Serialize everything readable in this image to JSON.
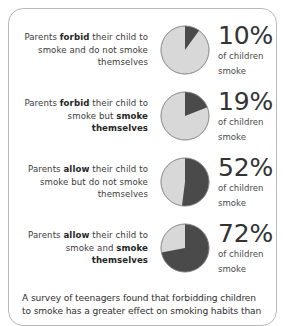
{
  "card": {
    "accent_dark": "#4a4a4a",
    "accent_light": "#d8d8d8",
    "border_color": "#b9b9b9"
  },
  "rows": [
    {
      "statement_pre": "Parents ",
      "statement_bold1": "forbid",
      "statement_mid": " their child to smoke and do not smoke themselves",
      "statement_bold2": "",
      "statement_post": "",
      "percent": "10%",
      "value": 10,
      "sub_line1": "of children",
      "sub_line2": "smoke"
    },
    {
      "statement_pre": "Parents ",
      "statement_bold1": "forbid",
      "statement_mid": " their child to smoke but ",
      "statement_bold2": "smoke themselves",
      "statement_post": "",
      "percent": "19%",
      "value": 19,
      "sub_line1": "of children",
      "sub_line2": "smoke"
    },
    {
      "statement_pre": "Parents ",
      "statement_bold1": "allow",
      "statement_mid": " their child to smoke but do not smoke themselves",
      "statement_bold2": "",
      "statement_post": "",
      "percent": "52%",
      "value": 52,
      "sub_line1": "of children",
      "sub_line2": "smoke"
    },
    {
      "statement_pre": "Parents ",
      "statement_bold1": "allow",
      "statement_mid": " their child to smoke and ",
      "statement_bold2": "smoke themselves",
      "statement_post": "",
      "percent": "72%",
      "value": 72,
      "sub_line1": "of children",
      "sub_line2": "smoke"
    }
  ],
  "footnote": {
    "text": "A survey of teenagers found that forbidding children to smoke has a greater effect on smoking habits than"
  },
  "chart_data": {
    "type": "pie",
    "unit": "percent",
    "categories": [
      "Parents forbid their child to smoke and do not smoke themselves",
      "Parents forbid their child to smoke but smoke themselves",
      "Parents allow their child to smoke but do not smoke themselves",
      "Parents allow their child to smoke and smoke themselves"
    ],
    "values": [
      10,
      19,
      52,
      72
    ],
    "slice_labels": [
      "children who smoke",
      "children who do not smoke"
    ],
    "colors": [
      "#4a4a4a",
      "#d8d8d8"
    ],
    "legend": "none",
    "start_angle_deg": 0,
    "direction": "clockwise"
  }
}
